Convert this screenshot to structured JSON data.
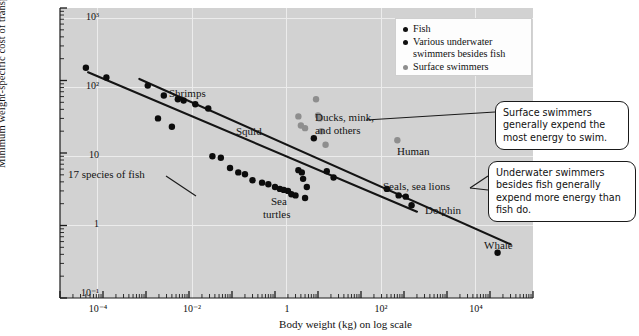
{
  "axes": {
    "ylabel": "Minimum weight-specific cost of transport (J/m•kg) on log scale",
    "xlabel": "Body weight (kg) on log scale",
    "yticks": [
      "10³",
      "10²",
      "10",
      "1",
      "10⁻¹"
    ],
    "xticks": [
      "10⁻⁴",
      "10⁻²",
      "1",
      "10²",
      "10⁴"
    ]
  },
  "legend": {
    "items": [
      {
        "label": "Fish",
        "marker": "black"
      },
      {
        "label": "Various underwater swimmers besides fish",
        "marker": "black"
      },
      {
        "label": "Surface swimmers",
        "marker": "gray"
      }
    ]
  },
  "annotations": {
    "shrimps": "Shrimps",
    "squid": "Squid",
    "fish_line": "17 species of fish",
    "sea_turtles_l1": "Sea",
    "sea_turtles_l2": "turtles",
    "ducks_l1": "Ducks, mink,",
    "ducks_l2": "and others",
    "human": "Human",
    "seals": "Seals, sea lions",
    "dolphin": "Dolphin",
    "whale": "Whale"
  },
  "callouts": {
    "surface": "Surface swimmers generally expend the most energy to swim.",
    "underwater": "Underwater swimmers besides fish generally expend more energy than fish do."
  },
  "colors": {
    "plot_background": "#d2d2d2",
    "gridline": "#ececec",
    "marker_black": "#0c0c0c",
    "marker_gray": "#8e8e8e",
    "trendline": "#141414"
  },
  "chart_data": {
    "type": "scatter",
    "title": "",
    "xlabel": "Body weight (kg) on log scale",
    "ylabel": "Minimum weight-specific cost of transport (J/m•kg) on log scale",
    "xscale": "log",
    "yscale": "log",
    "xlim": [
      1e-06,
      100000.0
    ],
    "ylim": [
      0.1,
      1000
    ],
    "xticks": [
      0.0001,
      0.01,
      1,
      100,
      10000
    ],
    "xticklabels": [
      "10⁻⁴",
      "10⁻²",
      "1",
      "10²",
      "10⁴"
    ],
    "yticks": [
      1000,
      100,
      10,
      1,
      0.1
    ],
    "yticklabels": [
      "10³",
      "10²",
      "10",
      "1",
      "10⁻¹"
    ],
    "grid": true,
    "legend_position": "top-right",
    "series": [
      {
        "name": "Various underwater swimmers besides fish",
        "color": "#0c0c0c",
        "points": [
          {
            "x": 4e-06,
            "y": 150,
            "label": "shrimp"
          },
          {
            "x": 1.2e-05,
            "y": 110,
            "label": "shrimp"
          },
          {
            "x": 0.00011,
            "y": 85,
            "label": "shrimp"
          },
          {
            "x": 0.00026,
            "y": 62,
            "label": "shrimp"
          },
          {
            "x": 0.00055,
            "y": 55,
            "label": "shrimp"
          },
          {
            "x": 0.00075,
            "y": 53,
            "label": "shrimp"
          },
          {
            "x": 0.0014,
            "y": 47,
            "label": "shrimp"
          },
          {
            "x": 0.0028,
            "y": 41,
            "label": "shrimp"
          },
          {
            "x": 0.8,
            "y": 16,
            "label": "squid"
          },
          {
            "x": 0.35,
            "y": 5.8,
            "label": "sea turtle"
          },
          {
            "x": 0.42,
            "y": 5.4,
            "label": "sea turtle"
          },
          {
            "x": 0.45,
            "y": 4.4,
            "label": "sea turtle"
          },
          {
            "x": 0.55,
            "y": 3.4,
            "label": "sea turtle"
          },
          {
            "x": 1.6,
            "y": 5.6,
            "label": "sea turtle"
          },
          {
            "x": 2.3,
            "y": 4.6,
            "label": "sea turtle"
          },
          {
            "x": 40,
            "y": 3.2,
            "label": "seal"
          },
          {
            "x": 75,
            "y": 2.6,
            "label": "sea lion"
          },
          {
            "x": 110,
            "y": 2.5,
            "label": "sea lion"
          },
          {
            "x": 150,
            "y": 1.9,
            "label": "dolphin"
          },
          {
            "x": 15000,
            "y": 0.42,
            "label": "whale"
          }
        ]
      },
      {
        "name": "Fish",
        "color": "#0c0c0c",
        "points": [
          {
            "x": 0.00019,
            "y": 30
          },
          {
            "x": 0.0004,
            "y": 23
          },
          {
            "x": 0.0035,
            "y": 9.0
          },
          {
            "x": 0.0055,
            "y": 8.6
          },
          {
            "x": 0.009,
            "y": 6.2
          },
          {
            "x": 0.014,
            "y": 5.4
          },
          {
            "x": 0.02,
            "y": 5.1
          },
          {
            "x": 0.03,
            "y": 4.2
          },
          {
            "x": 0.05,
            "y": 3.9
          },
          {
            "x": 0.07,
            "y": 3.7
          },
          {
            "x": 0.1,
            "y": 3.4
          },
          {
            "x": 0.13,
            "y": 3.2
          },
          {
            "x": 0.16,
            "y": 3.1
          },
          {
            "x": 0.2,
            "y": 3.0
          },
          {
            "x": 0.24,
            "y": 2.7
          },
          {
            "x": 0.3,
            "y": 2.6
          },
          {
            "x": 0.5,
            "y": 2.4
          }
        ]
      },
      {
        "name": "Surface swimmers",
        "color": "#8e8e8e",
        "points": [
          {
            "x": 0.35,
            "y": 32,
            "label": "duck"
          },
          {
            "x": 0.4,
            "y": 24,
            "label": "mink"
          },
          {
            "x": 0.5,
            "y": 22,
            "label": "duck"
          },
          {
            "x": 0.9,
            "y": 55,
            "label": "duck"
          },
          {
            "x": 1.0,
            "y": 33,
            "label": "duck"
          },
          {
            "x": 1.1,
            "y": 30,
            "label": "duck"
          },
          {
            "x": 1.2,
            "y": 20,
            "label": "duck"
          },
          {
            "x": 1.5,
            "y": 13,
            "label": "duck"
          },
          {
            "x": 70,
            "y": 15,
            "label": "human"
          }
        ]
      }
    ],
    "trendlines": [
      {
        "name": "Underwater swimmers besides fish trend",
        "x1": 7e-05,
        "y1": 105,
        "x2": 30000.0,
        "y2": 0.55
      },
      {
        "name": "17 species of fish trend",
        "x1": 4.5e-06,
        "y1": 130,
        "x2": 200.0,
        "y2": 1.55
      }
    ]
  }
}
